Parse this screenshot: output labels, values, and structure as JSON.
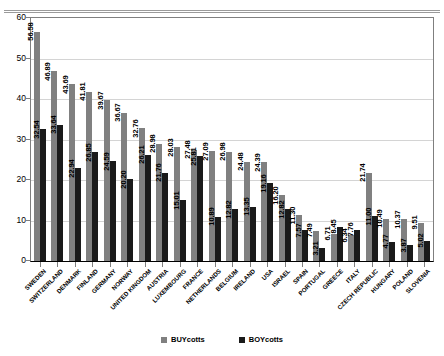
{
  "chart_data": {
    "type": "bar",
    "title": "",
    "xlabel": "",
    "ylabel": "",
    "ylim": [
      0,
      60
    ],
    "yticks": [
      0,
      10,
      20,
      30,
      40,
      50,
      60
    ],
    "grid": true,
    "legend_position": "bottom",
    "categories": [
      "SWEDEN",
      "SWITZERLAND",
      "DENMARK",
      "FINLAND",
      "GERMANY",
      "NORWAY",
      "UNITED KINGDOM",
      "AUSTRIA",
      "LUXEMBOURG",
      "FRANCE",
      "NETHERLANDS",
      "BELGIUM",
      "IRELAND",
      "USA",
      "ISRAEL",
      "SPAIN",
      "PORTUGAL",
      "GREECE",
      "ITALY",
      "CZECH REPUBLIC",
      "HUNGARY",
      "POLAND",
      "SLOVENIA"
    ],
    "series": [
      {
        "name": "BUYcotts",
        "color": "#808080",
        "values": [
          56.58,
          46.89,
          43.69,
          41.81,
          39.67,
          36.67,
          32.76,
          28.98,
          28.03,
          27.48,
          27.09,
          26.98,
          24.48,
          24.39,
          16.2,
          11.3,
          7.49,
          6.71,
          6.34,
          21.74,
          10.49,
          10.37,
          9.51
        ],
        "labels": [
          "56.58",
          "46.89",
          "43.69",
          "41.81",
          "39.67",
          "36.67",
          "32.76",
          "28.98",
          "28.03",
          "27.48",
          "27.09",
          "26.98",
          "24.48",
          "24.39",
          "16.20",
          "11.30",
          "7.49",
          "6.71",
          "6.34",
          "21.74",
          "10.49",
          "10.37",
          "9.51"
        ]
      },
      {
        "name": "BOYcotts",
        "color": "#1a1a1a",
        "values": [
          32.54,
          33.64,
          22.94,
          26.85,
          24.59,
          20.2,
          26.21,
          21.76,
          15.01,
          25.81,
          10.89,
          12.82,
          13.35,
          19.16,
          12.82,
          7.57,
          3.21,
          8.45,
          7.76,
          11.0,
          4.77,
          3.87,
          5.02
        ],
        "labels": [
          "32.54",
          "33.64",
          "22.94",
          "26.85",
          "24.59",
          "20.20",
          "26.21",
          "21.76",
          "15.01",
          "25.81",
          "10.89",
          "12.82",
          "13.35",
          "19.16",
          "12.82",
          "7.57",
          "3.21",
          "8.45",
          "7.76",
          "11.00",
          "4.77",
          "3.87",
          "5.02"
        ]
      }
    ]
  },
  "legend": {
    "items": [
      {
        "label": "BUYcotts",
        "color": "#808080"
      },
      {
        "label": "BOYcotts",
        "color": "#1a1a1a"
      }
    ]
  }
}
